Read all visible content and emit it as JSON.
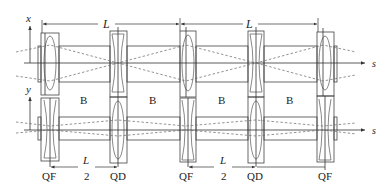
{
  "labels": {
    "x_axis": "x",
    "y_axis": "y",
    "s_upper": "s",
    "s_lower": "s",
    "period_L_1": "L",
    "period_L_2": "L",
    "half_L_1_num": "L",
    "half_L_1_den": "2",
    "half_L_2_num": "L",
    "half_L_2_den": "2"
  },
  "dipoles": [
    {
      "label": "B"
    },
    {
      "label": "B"
    },
    {
      "label": "B"
    },
    {
      "label": "B"
    }
  ],
  "quadrupoles": [
    {
      "label": "QF",
      "type": "focusing"
    },
    {
      "label": "QD",
      "type": "defocusing"
    },
    {
      "label": "QF",
      "type": "focusing"
    },
    {
      "label": "QD",
      "type": "defocusing"
    },
    {
      "label": "QF",
      "type": "focusing"
    }
  ],
  "colors": {
    "stroke": "#444444",
    "ray": "#666666",
    "background": "#ffffff"
  }
}
